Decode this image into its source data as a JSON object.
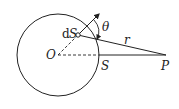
{
  "diagram": {
    "labels": {
      "dS_d": "d",
      "dS_S": "S",
      "theta": "θ",
      "O": "O",
      "S": "S",
      "r": "r",
      "P": "P"
    },
    "colors": {
      "stroke": "#222222",
      "background": "#ffffff"
    }
  }
}
